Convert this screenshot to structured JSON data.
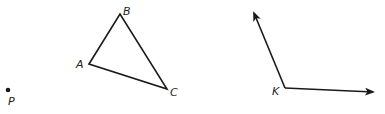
{
  "diagram": {
    "point": {
      "label": "P",
      "x": 8,
      "y": 90,
      "label_x": 8,
      "label_y": 105
    },
    "triangle": {
      "vertices": [
        {
          "label": "A",
          "x": 89,
          "y": 64,
          "label_x": 76,
          "label_y": 68
        },
        {
          "label": "B",
          "x": 120,
          "y": 14,
          "label_x": 123,
          "label_y": 15
        },
        {
          "label": "C",
          "x": 167,
          "y": 89,
          "label_x": 170,
          "label_y": 96
        }
      ]
    },
    "angle": {
      "vertex": {
        "label": "K",
        "x": 285,
        "y": 88,
        "label_x": 272,
        "label_y": 95
      },
      "rays": [
        {
          "name": "upper-ray",
          "tip_x": 254,
          "tip_y": 13
        },
        {
          "name": "right-ray",
          "tip_x": 373,
          "tip_y": 92
        }
      ]
    },
    "colors": {
      "ink": "#1a1a1a",
      "background": "#ffffff"
    }
  }
}
